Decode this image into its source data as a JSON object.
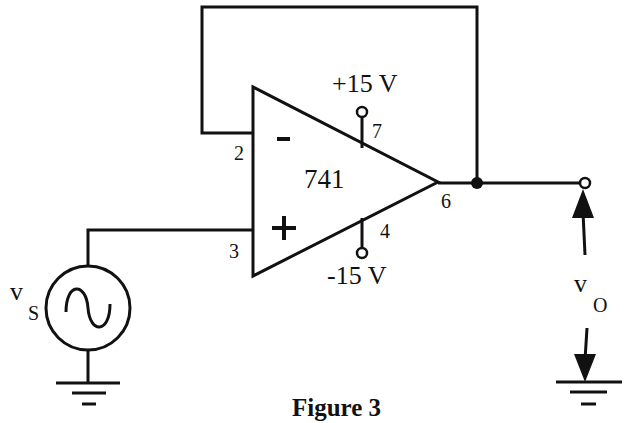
{
  "figure": {
    "caption": "Figure 3",
    "type": "op-amp voltage follower circuit"
  },
  "opamp": {
    "part": "741",
    "inverting_symbol": "-",
    "noninverting_symbol": "+",
    "pins": {
      "inverting": "2",
      "noninverting": "3",
      "output": "6",
      "vpos": "7",
      "vneg": "4"
    }
  },
  "supplies": {
    "positive": "+15 V",
    "negative": "-15 V"
  },
  "source": {
    "label_main": "v",
    "label_sub": "S",
    "kind": "AC sine source"
  },
  "output": {
    "label_main": "v",
    "label_sub": "O"
  },
  "colors": {
    "line": "#111111",
    "background": "#ffffff"
  }
}
